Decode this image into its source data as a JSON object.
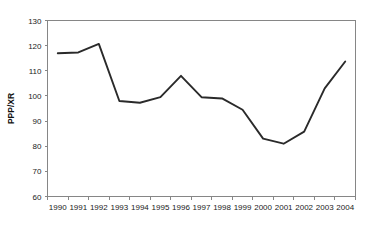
{
  "chart_data": {
    "type": "line",
    "title": "",
    "xlabel": "",
    "ylabel": "PPP/XR",
    "categories": [
      "1990",
      "1991",
      "1992",
      "1993",
      "1994",
      "1995",
      "1996",
      "1997",
      "1998",
      "1999",
      "2000",
      "2001",
      "2002",
      "2003",
      "2004"
    ],
    "values": [
      117.0,
      117.3,
      120.7,
      98.0,
      97.3,
      99.5,
      108.0,
      99.5,
      99.0,
      94.5,
      83.0,
      81.0,
      85.8,
      103.0,
      113.7
    ],
    "series": [
      {
        "name": "PPP/XR",
        "values": [
          117.0,
          117.3,
          120.7,
          98.0,
          97.3,
          99.5,
          108.0,
          99.5,
          99.0,
          94.5,
          83.0,
          81.0,
          85.8,
          103.0,
          113.7
        ]
      }
    ],
    "ylim": [
      60,
      130
    ],
    "ytick_values": [
      60,
      70,
      80,
      90,
      100,
      110,
      120,
      130
    ],
    "ytick_labels": [
      "60",
      "70",
      "80",
      "90",
      "100",
      "110",
      "120",
      "130"
    ],
    "grid": false,
    "legend": false,
    "legend_position": "none",
    "line_color": "#2a2a2a",
    "axis_color": "#868686"
  },
  "axis": {
    "y_title": "PPP/XR"
  }
}
